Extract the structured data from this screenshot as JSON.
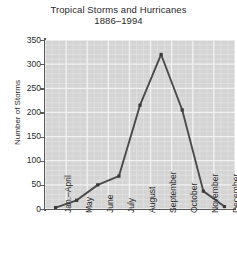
{
  "chart_data": {
    "type": "line",
    "title": "Tropical Storms and Hurricanes",
    "subtitle": "1886–1994",
    "xlabel": "",
    "ylabel": "Number of Storms",
    "categories": [
      "Jan.–April",
      "May",
      "June",
      "July",
      "August",
      "September",
      "October",
      "November",
      "December"
    ],
    "values": [
      3,
      18,
      50,
      68,
      215,
      320,
      205,
      37,
      5
    ],
    "ylim": [
      0,
      350
    ],
    "ytick_labels": [
      "0",
      "50",
      "100",
      "150",
      "200",
      "250",
      "300",
      "350"
    ],
    "ytick_values": [
      0,
      50,
      100,
      150,
      200,
      250,
      300,
      350
    ],
    "grid": true,
    "minor_grid": true,
    "legend": "none",
    "series": [
      {
        "name": "Number of Storms",
        "values": [
          3,
          18,
          50,
          68,
          215,
          320,
          205,
          37,
          5
        ]
      }
    ]
  },
  "style": {
    "plot_background": "#d4d4d4",
    "gridline_color": "#f2f2f2",
    "minor_gridline_color": "#e2e2e2",
    "line_color": "#4a4a4a",
    "marker_color": "#3a3a3a",
    "axis_color": "#5a5a5a",
    "text_color": "#2a2a2a"
  }
}
